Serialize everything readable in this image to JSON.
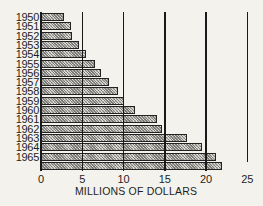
{
  "chart_data": {
    "type": "bar",
    "orientation": "horizontal",
    "title": "",
    "xlabel": "MILLIONS OF DOLLARS",
    "ylabel": "",
    "xlim": [
      0,
      25
    ],
    "x_ticks": [
      "0",
      "5",
      "10",
      "15",
      "20",
      "25"
    ],
    "grid": "vertical lines at major ticks",
    "legend": null,
    "categories": [
      "1950",
      "1951",
      "1952",
      "1953",
      "1954",
      "1955",
      "1956",
      "1957",
      "1958",
      "1959",
      "1960",
      "1961",
      "1962",
      "1963",
      "1964",
      "1965",
      ""
    ],
    "values": [
      2.8,
      3.6,
      3.8,
      4.6,
      5.5,
      6.5,
      7.3,
      8.3,
      9.3,
      10.1,
      11.4,
      14.0,
      14.7,
      17.7,
      19.5,
      21.2,
      21.9
    ],
    "note": "16 year labels but a 17th unlabeled bar appears at the bottom of the chart"
  }
}
